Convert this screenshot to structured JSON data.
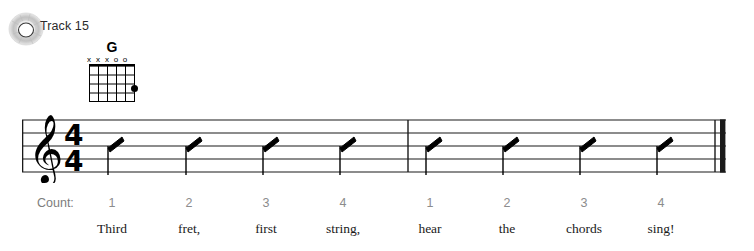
{
  "track": {
    "icon": "cd-disc-icon",
    "label": "Track 15"
  },
  "chord": {
    "name": "G",
    "icon": "guitar-chord-diagram",
    "strings": 6,
    "frets": 4,
    "string_markers": [
      "x",
      "x",
      "x",
      "o",
      "o",
      ""
    ],
    "dots": [
      {
        "string": 6,
        "fret": 3
      }
    ]
  },
  "staff": {
    "clef": "treble-clef",
    "time_signature": {
      "numerator": "4",
      "denominator": "4"
    },
    "barline_start": "thin",
    "barline_middle": "thin",
    "barline_end": "final-double",
    "notation_style": "rhythm-slash",
    "measures": [
      {
        "beats": [
          "slash",
          "slash",
          "slash",
          "slash"
        ]
      },
      {
        "beats": [
          "slash",
          "slash",
          "slash",
          "slash"
        ]
      }
    ]
  },
  "count": {
    "label": "Count:",
    "numbers": [
      "1",
      "2",
      "3",
      "4",
      "1",
      "2",
      "3",
      "4"
    ],
    "color": "#8c8c8c"
  },
  "lyrics": {
    "words": [
      "Third",
      "fret,",
      "first",
      "string,",
      "hear",
      "the",
      "chords",
      "sing!"
    ]
  },
  "colors": {
    "ink": "#000000",
    "count_gray": "#8c8c8c",
    "lyric_ink": "#1a1a1a",
    "background": "#ffffff"
  }
}
